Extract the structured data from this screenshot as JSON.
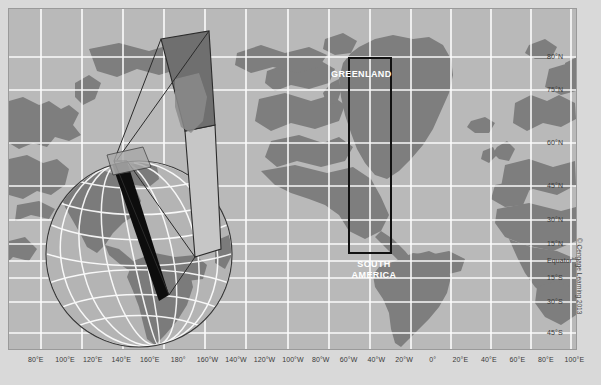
{
  "figure": {
    "background_color": "#d9d9d9",
    "ocean_color": "#b9b9b9",
    "land_color": "#7f7f7f",
    "graticule_color": "#ffffff",
    "gore_dark_color": "#6e6e6e",
    "gore_light_color": "#c9c9c9",
    "wedge_color": "#111111",
    "outline_color": "#2a2a2a"
  },
  "map_labels": {
    "greenland": "GREENLAND",
    "south_america_line1": "SOUTH",
    "south_america_line2": "AMERICA"
  },
  "credit": "© Cengage Learning 2013",
  "axes": {
    "longitude_labels": [
      {
        "text": "80°E",
        "x": 40
      },
      {
        "text": "100°E",
        "x": 82
      },
      {
        "text": "120°E",
        "x": 122
      },
      {
        "text": "140°E",
        "x": 163
      },
      {
        "text": "160°E",
        "x": 204
      },
      {
        "text": "180°",
        "x": 245
      },
      {
        "text": "160°W",
        "x": 287
      },
      {
        "text": "140°W",
        "x": 328
      },
      {
        "text": "120°W",
        "x": 369
      },
      {
        "text": "100°W",
        "x": 410
      },
      {
        "text": "80°W",
        "x": 450
      },
      {
        "text": "60°W",
        "x": 490
      },
      {
        "text": "40°W",
        "x": 530
      },
      {
        "text": "20°W",
        "x": 570
      },
      {
        "text": "0°",
        "x": 611
      },
      {
        "text": "20°E",
        "x": 651
      },
      {
        "text": "40°E",
        "x": 692
      },
      {
        "text": "60°E",
        "x": 733
      },
      {
        "text": "80°E",
        "x": 774
      },
      {
        "text": "100°E",
        "x": 815
      }
    ],
    "latitude_labels": [
      {
        "text": "80°N",
        "y": 56
      },
      {
        "text": "75°N",
        "y": 89
      },
      {
        "text": "60°N",
        "y": 142
      },
      {
        "text": "45°N",
        "y": 185
      },
      {
        "text": "30°N",
        "y": 219
      },
      {
        "text": "15°N",
        "y": 243
      },
      {
        "text": "Equator",
        "y": 260
      },
      {
        "text": "15°S",
        "y": 277
      },
      {
        "text": "30°S",
        "y": 301
      },
      {
        "text": "45°S",
        "y": 332
      }
    ]
  },
  "chart_data": {
    "type": "map",
    "projection": "Mercator",
    "annotation_boxes": [
      {
        "name": "greenland-comparison-box",
        "x": 348,
        "y": 57,
        "w": 42,
        "h": 195
      }
    ],
    "grid": true,
    "legend": "none"
  }
}
